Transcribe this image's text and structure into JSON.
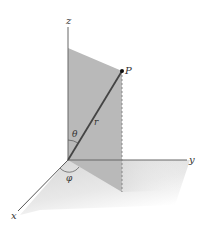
{
  "diagram": {
    "type": "spherical-coordinates",
    "axes": {
      "x_label": "x",
      "y_label": "y",
      "z_label": "z"
    },
    "point": {
      "label": "P"
    },
    "radius_label": "r",
    "polar_angle_label": "θ",
    "azimuth_angle_label": "φ",
    "colors": {
      "plane": "#b8b8b8",
      "axis": "#555555",
      "radius_line": "#444444",
      "shadow": "#d6d6d6"
    }
  }
}
